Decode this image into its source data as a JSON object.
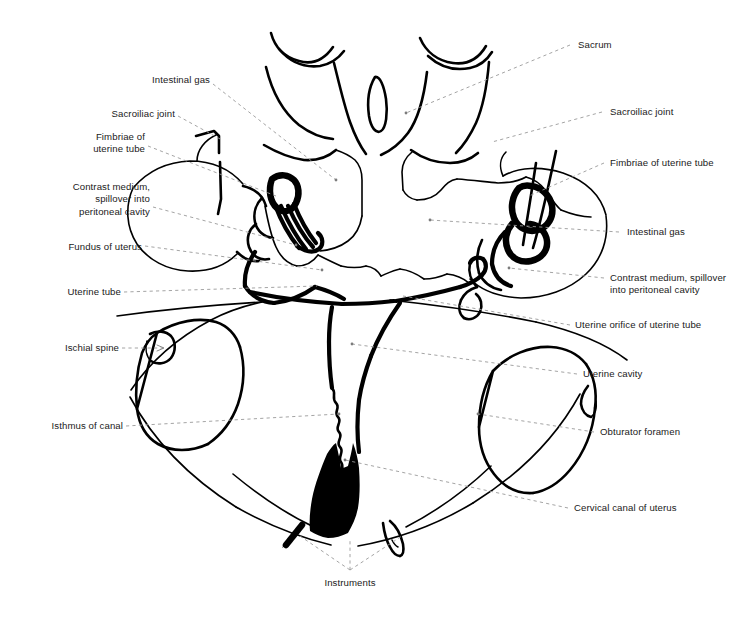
{
  "figure": {
    "type": "anatomical-line-drawing",
    "background_color": "#ffffff",
    "ink_color": "#000000",
    "leader_line_color": "#9a9a9a"
  },
  "labels_left": [
    {
      "id": "intestinal-gas-left",
      "text": "Intestinal gas"
    },
    {
      "id": "sacroiliac-joint-left",
      "text": "Sacroiliac joint"
    },
    {
      "id": "fimbriae-left",
      "text": "Fimbriae of\nuterine tube"
    },
    {
      "id": "contrast-medium-left",
      "text": "Contrast medium,\nspillover into\nperitoneal cavity"
    },
    {
      "id": "fundus-of-uterus",
      "text": "Fundus of uterus"
    },
    {
      "id": "uterine-tube",
      "text": "Uterine tube"
    },
    {
      "id": "ischial-spine",
      "text": "Ischial spine"
    },
    {
      "id": "isthmus-of-canal",
      "text": "Isthmus of canal"
    }
  ],
  "labels_right": [
    {
      "id": "sacrum",
      "text": "Sacrum"
    },
    {
      "id": "sacroiliac-joint-right",
      "text": "Sacroiliac joint"
    },
    {
      "id": "fimbriae-right",
      "text": "Fimbriae of uterine tube"
    },
    {
      "id": "intestinal-gas-right",
      "text": "Intestinal gas"
    },
    {
      "id": "contrast-medium-right",
      "text": "Contrast medium, spillover\ninto peritoneal cavity"
    },
    {
      "id": "uterine-orifice",
      "text": "Uterine orifice of uterine tube"
    },
    {
      "id": "uterine-cavity",
      "text": "Uterine cavity"
    },
    {
      "id": "obturator-foramen",
      "text": "Obturator foramen"
    },
    {
      "id": "cervical-canal",
      "text": "Cervical canal of uterus"
    }
  ],
  "labels_bottom": [
    {
      "id": "instruments",
      "text": "Instruments"
    }
  ]
}
